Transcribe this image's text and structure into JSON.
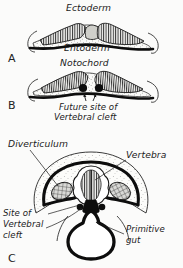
{
  "figure": {
    "background_color": "#fbfbfa",
    "ink_color": "#1a1a1a",
    "panel_count": 3
  },
  "panels": [
    {
      "letter": "A",
      "letter_x": 9,
      "letter_y": 60,
      "labels": [
        {
          "text": "Ectoderm",
          "x": 66,
          "y": 11
        },
        {
          "text": "Entoderm",
          "x": 64,
          "y": 51
        }
      ],
      "structures": [
        "ectoderm",
        "entoderm",
        "mesoderm-stipple"
      ]
    },
    {
      "letter": "B",
      "letter_x": 9,
      "letter_y": 107,
      "labels": [
        {
          "text": "Notochord",
          "x": 60,
          "y": 64
        },
        {
          "text": "Future site of",
          "x": 60,
          "y": 108
        },
        {
          "text": "Vertebral cleft",
          "x": 56,
          "y": 118
        }
      ],
      "structures": [
        "notochord-pair",
        "cleft-arrows",
        "entoderm",
        "ectoderm"
      ]
    },
    {
      "letter": "C",
      "letter_x": 9,
      "letter_y": 259,
      "labels": [
        {
          "text": "Diverticulum",
          "x": 8,
          "y": 146
        },
        {
          "text": "Vertebra",
          "x": 127,
          "y": 157
        },
        {
          "text": "Site of",
          "x": 4,
          "y": 214
        },
        {
          "text": "Vertebral",
          "x": 4,
          "y": 225
        },
        {
          "text": "cleft",
          "x": 4,
          "y": 236
        },
        {
          "text": "Primitive",
          "x": 127,
          "y": 230
        },
        {
          "text": "gut",
          "x": 127,
          "y": 241
        }
      ],
      "structures": [
        "vertebra",
        "diverticulum-left",
        "diverticulum-right",
        "primitive-gut",
        "vertebral-cleft"
      ]
    }
  ],
  "legend_terms": [
    "Ectoderm",
    "Entoderm",
    "Notochord",
    "Future site of Vertebral cleft",
    "Diverticulum",
    "Vertebra",
    "Site of Vertebral cleft",
    "Primitive gut"
  ]
}
